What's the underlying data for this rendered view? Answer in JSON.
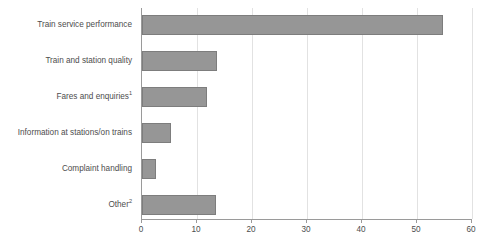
{
  "chart_data": {
    "type": "bar",
    "orientation": "horizontal",
    "title": "",
    "xlabel": "",
    "ylabel": "",
    "xlim": [
      0,
      60
    ],
    "xticks": [
      0,
      10,
      20,
      30,
      40,
      50,
      60
    ],
    "grid": true,
    "legend": false,
    "categories": [
      "Train service performance",
      "Train and station quality",
      "Fares and enquiries",
      "Information at stations/on trains",
      "Complaint handling",
      "Other"
    ],
    "category_footnotes": [
      "",
      "",
      "1",
      "",
      "",
      "2"
    ],
    "values": [
      54.7,
      13.7,
      11.8,
      5.2,
      2.5,
      13.5
    ],
    "series_color": "#969696",
    "bar_border_color": "#7d7d7d",
    "gridline_color": "#e2e2e2",
    "axis_color": "#9a9a9a",
    "text_color": "#4d4d4d"
  },
  "clipped_heading": " "
}
